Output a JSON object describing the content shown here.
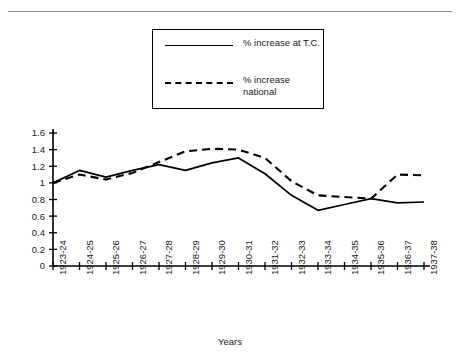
{
  "chart_data": {
    "type": "line",
    "title": "",
    "xlabel": "Years",
    "ylabel": "",
    "ylim": [
      0,
      1.6
    ],
    "yticks": [
      "0",
      "0.2",
      "0.4",
      "0.6",
      "0.8",
      "1",
      "1.2",
      "1.4",
      "1.6"
    ],
    "ytick_values": [
      0,
      0.2,
      0.4,
      0.6,
      0.8,
      1.0,
      1.2,
      1.4,
      1.6
    ],
    "grid": false,
    "legend_position": "top-center",
    "categories": [
      "1923-24",
      "1924-25",
      "1925-26",
      "1926-27",
      "1927-28",
      "1928-29",
      "1929-30",
      "1930-31",
      "1931-32",
      "1932-33",
      "1933-34",
      "1934-35",
      "1935-36",
      "1936-37",
      "1937-38"
    ],
    "series": [
      {
        "name": "% increase at T.C.",
        "style": "solid",
        "color": "#000000",
        "values": [
          1.0,
          1.15,
          1.07,
          1.15,
          1.22,
          1.15,
          1.24,
          1.3,
          1.11,
          0.85,
          0.67,
          0.74,
          0.81,
          0.76,
          0.77
        ]
      },
      {
        "name": "% increase national",
        "style": "dashed",
        "color": "#000000",
        "values": [
          1.0,
          1.1,
          1.04,
          1.12,
          1.25,
          1.38,
          1.41,
          1.4,
          1.3,
          1.02,
          0.85,
          0.83,
          0.81,
          1.1,
          1.09
        ]
      }
    ]
  },
  "legend": {
    "entries": [
      {
        "label": "% increase at T.C.",
        "style": "solid"
      },
      {
        "label": "% increase\nnational",
        "style": "dashed"
      }
    ]
  },
  "axes": {
    "x_title": "Years"
  }
}
